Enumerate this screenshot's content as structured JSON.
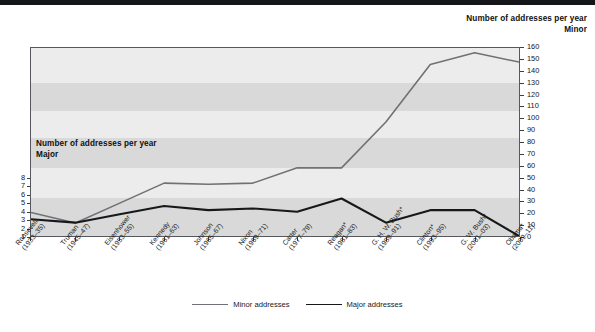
{
  "titles": {
    "right_line1": "Number of addresses per year",
    "right_line2": "Minor",
    "inner_line1": "Number of addresses per year",
    "inner_line2": "Major"
  },
  "legend": {
    "minor_label": "Minor addresses",
    "major_label": "Major addresses"
  },
  "colors": {
    "minor_line": "#6e7176",
    "major_line": "#17181a",
    "plot_background": "#e9e9e9",
    "band_light": "#ececec",
    "band_dark": "#d9d9d9",
    "axis": "#55585c"
  },
  "chart_data": {
    "type": "line",
    "title": "Number of addresses per year",
    "xlabel": "",
    "ylabel": "Major",
    "y2label": "Minor",
    "grid": false,
    "legend_position": "bottom-center",
    "categories": [
      "Roosevelt\n(1933–35)",
      "Truman\n(1945–47)",
      "Eisenhower\n(1953–55)",
      "Kennedy\n(1961–63)",
      "Johnson\n(1965–67)",
      "Nixon\n(1969–71)",
      "Carter\n(1977–79)",
      "Reagan*\n(1981–83)",
      "G. H. W. Bush*\n(1989–91)",
      "Clinton*\n(1993–95)",
      "G. W. Bush*\n(2001–03)",
      "Obama*\n(2009–11)"
    ],
    "category_names": [
      "Roosevelt",
      "Truman",
      "Eisenhower",
      "Kennedy",
      "Johnson",
      "Nixon",
      "Carter",
      "Reagan*",
      "G. H. W. Bush*",
      "Clinton*",
      "G. W. Bush*",
      "Obama*"
    ],
    "category_years": [
      "(1933–35)",
      "(1945–47)",
      "(1953–55)",
      "(1961–63)",
      "(1965–67)",
      "(1969–71)",
      "(1977–79)",
      "(1981–83)",
      "(1989–91)",
      "(1993–95)",
      "(2001–03)",
      "(2009–11)"
    ],
    "ylim": [
      1,
      8
    ],
    "yticks": [
      1,
      2,
      3,
      4,
      5,
      6,
      7,
      8
    ],
    "y2lim": [
      0,
      160
    ],
    "y2ticks": [
      0,
      10,
      20,
      30,
      40,
      50,
      60,
      70,
      80,
      90,
      100,
      110,
      120,
      130,
      140,
      150,
      160
    ],
    "series": [
      {
        "name": "Major addresses",
        "axis": "left",
        "color": "#17181a",
        "values": [
          3.0,
          2.6,
          3.6,
          4.6,
          4.1,
          4.3,
          3.9,
          5.5,
          2.6,
          4.1,
          4.1,
          1.0
        ]
      },
      {
        "name": "Minor addresses",
        "axis": "right",
        "color": "#6e7176",
        "values": [
          20,
          11,
          28,
          45,
          44,
          45,
          58,
          58,
          97,
          146,
          156,
          148
        ]
      }
    ]
  }
}
